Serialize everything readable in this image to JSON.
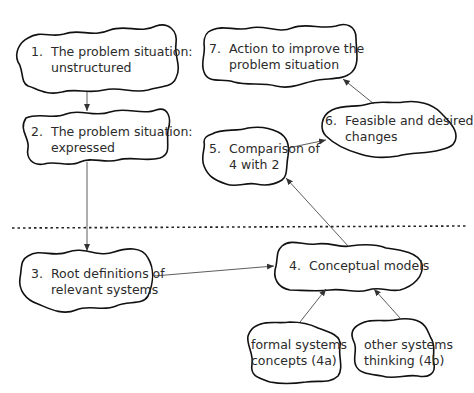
{
  "diagram": {
    "type": "soft-systems-methodology",
    "divider": "dotted horizontal line separating real world (above) from systems thinking (below)",
    "nodes": [
      {
        "id": "n1",
        "number": "1.",
        "line1": "The problem situation:",
        "line2": "unstructured"
      },
      {
        "id": "n2",
        "number": "2.",
        "line1": "The problem situation:",
        "line2": "expressed"
      },
      {
        "id": "n3",
        "number": "3.",
        "line1": "Root definitions of",
        "line2": "relevant systems"
      },
      {
        "id": "n4",
        "number": "4.",
        "line1": "Conceptual models",
        "line2": ""
      },
      {
        "id": "n4a",
        "number": "",
        "line1": "formal systems",
        "line2": "concepts (4a)"
      },
      {
        "id": "n4b",
        "number": "",
        "line1": "other systems",
        "line2": "thinking (4b)"
      },
      {
        "id": "n5",
        "number": "5.",
        "line1": "Comparison of",
        "line2": "4 with 2"
      },
      {
        "id": "n6",
        "number": "6.",
        "line1": "Feasible and desired",
        "line2": "changes"
      },
      {
        "id": "n7",
        "number": "7.",
        "line1": "Action to improve the",
        "line2": "problem situation"
      }
    ],
    "edges": [
      {
        "from": "n1",
        "to": "n2"
      },
      {
        "from": "n2",
        "to": "n3"
      },
      {
        "from": "n3",
        "to": "n4"
      },
      {
        "from": "n4a",
        "to": "n4"
      },
      {
        "from": "n4b",
        "to": "n4"
      },
      {
        "from": "n4",
        "to": "n5"
      },
      {
        "from": "n5",
        "to": "n6"
      },
      {
        "from": "n6",
        "to": "n7"
      }
    ]
  }
}
